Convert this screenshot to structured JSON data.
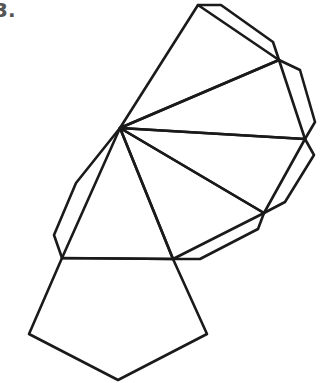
{
  "problem": {
    "number_label": "3."
  },
  "figure": {
    "stroke_color": "#1a1a1a",
    "stroke_width": 2.6,
    "apex": [
      120,
      128
    ],
    "fan_vertices": [
      [
        62,
        258
      ],
      [
        173,
        259
      ],
      [
        264,
        213
      ],
      [
        305,
        139
      ],
      [
        279,
        60
      ],
      [
        198,
        5
      ]
    ],
    "base_pentagon": [
      [
        62,
        258
      ],
      [
        173,
        259
      ],
      [
        207,
        334
      ],
      [
        118,
        380
      ],
      [
        29,
        334
      ]
    ],
    "flaps": [
      [
        [
          198,
          5
        ],
        [
          221,
          5
        ],
        [
          273,
          42
        ],
        [
          279,
          60
        ]
      ],
      [
        [
          279,
          60
        ],
        [
          300,
          70
        ],
        [
          315,
          122
        ],
        [
          305,
          139
        ]
      ],
      [
        [
          305,
          139
        ],
        [
          314,
          155
        ],
        [
          285,
          202
        ],
        [
          264,
          213
        ]
      ],
      [
        [
          264,
          213
        ],
        [
          258,
          229
        ],
        [
          200,
          259
        ],
        [
          173,
          259
        ]
      ],
      [
        [
          120,
          128
        ],
        [
          76,
          183
        ],
        [
          54,
          235
        ],
        [
          62,
          258
        ]
      ]
    ]
  }
}
